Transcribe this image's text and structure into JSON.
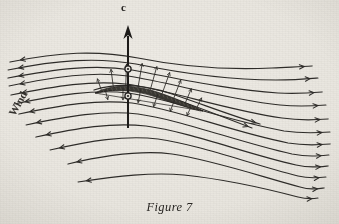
{
  "figure": {
    "caption": "Figure 7",
    "lift_vector_label": "c",
    "flow_direction_label": "Wind"
  },
  "colors": {
    "paper": "#e9e7e1",
    "ink": "#2e2c29",
    "ink_dark": "#1d1b19",
    "foil_fill": "#3a3833"
  },
  "chart_data": {
    "type": "line",
    "title": "Figure 7",
    "xlabel": "",
    "ylabel": "",
    "annotations": [
      "c",
      "Wind"
    ],
    "legend": [],
    "grid": false,
    "xlim": [
      0,
      339
    ],
    "ylim": [
      0,
      224
    ],
    "series": [
      {
        "name": "streamline-1",
        "arrow_left": true,
        "arrow_right": true,
        "path": "M 10,62 C 60,52 96,50 138,58 C 182,67 226,70 272,68 C 290,67 300,67 312,66"
      },
      {
        "name": "streamline-2",
        "arrow_left": true,
        "arrow_right": true,
        "path": "M 8,70 C 58,60 96,57 136,64 C 180,73 228,80 276,80 C 295,80 306,79 318,78"
      },
      {
        "name": "streamline-3",
        "arrow_left": true,
        "arrow_right": true,
        "path": "M 8,78 C 56,69 94,64 132,70 C 176,78 228,90 278,93 C 298,94 310,93 322,92"
      },
      {
        "name": "streamline-4",
        "arrow_left": true,
        "arrow_right": true,
        "path": "M 9,86 C 55,77 92,71 128,76 C 172,83 226,99 280,105 C 300,107 313,106 326,105"
      },
      {
        "name": "streamline-5",
        "arrow_left": true,
        "arrow_right": true,
        "path": "M 11,95 C 56,86 92,80 126,84 C 170,90 226,110 282,118 C 302,121 315,120 328,119"
      },
      {
        "name": "streamline-6",
        "arrow_left": true,
        "arrow_right": true,
        "path": "M 14,104 C 58,95 94,89 128,93 C 172,99 228,121 284,131 C 304,134 317,133 330,132"
      },
      {
        "name": "streamline-7",
        "arrow_left": true,
        "arrow_right": true,
        "path": "M 19,114 C 62,105 98,99 132,103 C 176,109 232,132 288,143 C 306,146 318,145 330,144"
      },
      {
        "name": "streamline-8",
        "arrow_left": true,
        "arrow_right": true,
        "path": "M 26,125 C 68,116 104,110 138,114 C 182,120 238,142 292,154 C 308,157 318,156 329,155"
      },
      {
        "name": "streamline-9",
        "arrow_left": true,
        "arrow_right": true,
        "path": "M 36,137 C 78,128 112,122 146,126 C 190,132 244,153 296,165 C 310,168 318,167 328,166"
      },
      {
        "name": "streamline-10",
        "arrow_left": true,
        "arrow_right": true,
        "path": "M 50,150 C 90,141 124,135 158,139 C 200,145 250,164 298,176 C 310,179 318,178 326,177"
      },
      {
        "name": "streamline-11",
        "arrow_left": true,
        "arrow_right": true,
        "path": "M 68,164 C 106,155 140,150 172,154 C 212,160 256,175 300,187 C 310,190 316,189 324,188"
      },
      {
        "name": "streamline-12",
        "arrow_left": true,
        "arrow_right": true,
        "path": "M 78,182 C 118,176 152,172 184,175 C 222,179 260,187 298,197 C 306,199 312,199 318,198"
      },
      {
        "name": "upper-close-1",
        "arrow_left": false,
        "arrow_right": true,
        "path": "M 94,90 C 116,83 142,84 172,94 C 202,104 232,116 260,124"
      },
      {
        "name": "upper-close-2",
        "arrow_left": false,
        "arrow_right": true,
        "path": "M 96,93 C 118,87 144,89 174,99 C 204,109 230,120 252,128"
      }
    ],
    "airfoil": {
      "name": "cambered-plate-section",
      "upper": "M 95,93 C 112,84 134,84 160,93 C 180,100 196,107 203,111",
      "lower": "M 203,111 C 194,110 176,104 156,97 C 132,89 112,89 95,93"
    },
    "lift_vector": {
      "x": 128,
      "y_base": 128,
      "y_tip": 25,
      "label": "c"
    },
    "pressure_arrows_upper": 9,
    "pressure_arrows_lower": 6,
    "center_of_pressure_markers": [
      {
        "x": 128,
        "y": 69
      },
      {
        "x": 128,
        "y": 96
      }
    ]
  }
}
